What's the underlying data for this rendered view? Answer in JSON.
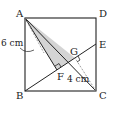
{
  "diagram": {
    "type": "geometry",
    "shape": "square ABCD with segment BE, shaded triangle AFG",
    "points": {
      "A": {
        "label": "A",
        "x": 25,
        "y": 18
      },
      "B": {
        "label": "B",
        "x": 25,
        "y": 91
      },
      "C": {
        "label": "C",
        "x": 96,
        "y": 91
      },
      "D": {
        "label": "D",
        "x": 96,
        "y": 18
      },
      "E": {
        "label": "E",
        "x": 96,
        "y": 44
      },
      "F": {
        "label": "F",
        "x": 57,
        "y": 70
      },
      "G": {
        "label": "G",
        "x": 75,
        "y": 58
      }
    },
    "measurements": {
      "AF": "6 cm",
      "CG": "4 cm"
    },
    "colors": {
      "line": "#222222",
      "shade": "#d4d4d4",
      "dash": "#888888"
    }
  }
}
